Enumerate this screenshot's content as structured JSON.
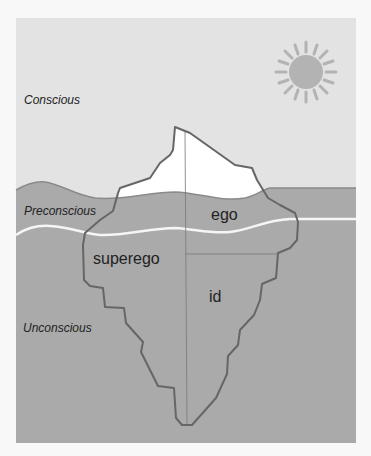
{
  "diagram": {
    "layers": [
      {
        "id": "conscious",
        "label": "Conscious"
      },
      {
        "id": "preconscious",
        "label": "Preconscious"
      },
      {
        "id": "unconscious",
        "label": "Unconscious"
      }
    ],
    "parts": [
      {
        "id": "ego",
        "label": "ego"
      },
      {
        "id": "superego",
        "label": "superego"
      },
      {
        "id": "id",
        "label": "id"
      }
    ],
    "colors": {
      "sky": "#e3e3e3",
      "water": "#aaaaaa",
      "iceberg_tip": "#ffffff",
      "outline": "#666666",
      "divider_line": "#f5f5f5",
      "sun": "#b3b3b3"
    }
  }
}
